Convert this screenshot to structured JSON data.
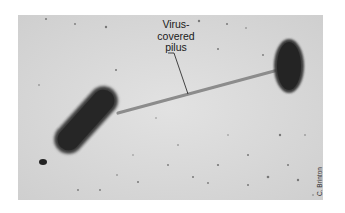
{
  "figure": {
    "annotation": {
      "line1": "Virus-",
      "line2": "covered",
      "line3": "pilus"
    },
    "credit": "C. Brinton"
  },
  "colors": {
    "background": "#d9d9d9",
    "cell": "#2a2a2a",
    "pilus": "#8a8a8a",
    "text": "#1a1a1a"
  }
}
